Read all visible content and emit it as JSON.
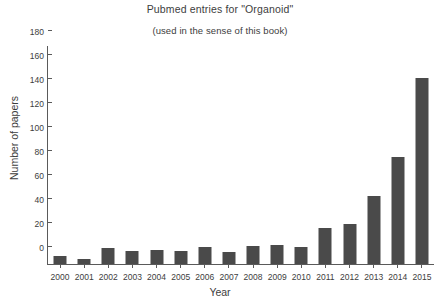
{
  "chart_data": {
    "type": "bar",
    "title": "Pubmed entries for \"Organoid\"",
    "subtitle": "(used in the sense of this book)",
    "xlabel": "Year",
    "ylabel": "Number of papers",
    "categories": [
      "2000",
      "2001",
      "2002",
      "2003",
      "2004",
      "2005",
      "2006",
      "2007",
      "2008",
      "2009",
      "2010",
      "2011",
      "2012",
      "2013",
      "2014",
      "2015"
    ],
    "values": [
      7,
      4,
      13,
      11,
      12,
      11,
      14,
      10,
      15,
      16,
      14,
      30,
      33,
      57,
      89,
      155
    ],
    "ylim": [
      0,
      180
    ],
    "ytick_labels": [
      "0",
      "20",
      "40",
      "60",
      "80",
      "100",
      "120",
      "140",
      "160",
      "180"
    ],
    "ytick_values": [
      0,
      20,
      40,
      60,
      80,
      100,
      120,
      140,
      160,
      180
    ],
    "grid": false,
    "legend": false,
    "bar_color": "#4a4a4a",
    "axis_color": "#5a5a5a",
    "background": "#ffffff"
  }
}
